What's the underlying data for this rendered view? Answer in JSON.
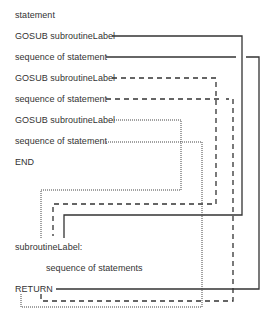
{
  "diagram": {
    "program_lines": [
      {
        "text": "statement"
      },
      {
        "text": "GOSUB subroutineLabel"
      },
      {
        "text": "sequence of statement"
      },
      {
        "text": "GOSUB subroutineLabel"
      },
      {
        "text": "sequence of statement"
      },
      {
        "text": "GOSUB subroutineLabel"
      },
      {
        "text": "sequence of statement"
      },
      {
        "text": "END"
      }
    ],
    "subroutine": {
      "label": "subroutineLabel:",
      "body": "sequence of statements",
      "return": "RETURN"
    },
    "connectors": [
      {
        "style": "solid",
        "from": "GOSUB subroutineLabel (1)",
        "to": "subroutineLabel:",
        "return_to": "sequence of statement (1)"
      },
      {
        "style": "dashed",
        "from": "GOSUB subroutineLabel (2)",
        "to": "subroutineLabel:",
        "return_to": "sequence of statement (2)"
      },
      {
        "style": "dotted",
        "from": "GOSUB subroutineLabel (3)",
        "to": "subroutineLabel:",
        "return_to": "sequence of statement (3)"
      }
    ]
  }
}
